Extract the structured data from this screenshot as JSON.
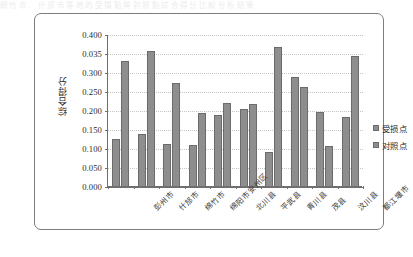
{
  "artifact_text": "綿 竹 市 、 什 邡 市 等 地 的 受 損 點 與 對 照 點 綜 合 得 分 比 較 分 析 結 果",
  "chart_data": {
    "type": "bar",
    "title": "",
    "xlabel": "",
    "ylabel": "综合得分",
    "ylim": [
      0.0,
      0.4
    ],
    "ytick_labels": [
      "0.400",
      "0.035",
      "0.300",
      "0.250",
      "0.200",
      "0.150",
      "0.100",
      "0.050",
      "0.000"
    ],
    "ytick_values": [
      0.4,
      0.35,
      0.3,
      0.25,
      0.2,
      0.15,
      0.1,
      0.05,
      0.0
    ],
    "grid": true,
    "legend_position": "right",
    "categories": [
      "彭州市",
      "什邡市",
      "绵竹市",
      "绵阳市安州区",
      "北川县",
      "平武县",
      "青川县",
      "茂县",
      "汶川县",
      "都江堰市"
    ],
    "series": [
      {
        "name": "受损点",
        "color": "#8e8e8e",
        "values": [
          0.125,
          0.138,
          0.11,
          0.107,
          0.187,
          0.202,
          0.09,
          0.287,
          0.194,
          0.181
        ]
      },
      {
        "name": "对照点",
        "color": "#8e8e8e",
        "values": [
          0.33,
          0.355,
          0.272,
          0.192,
          0.218,
          0.217,
          0.365,
          0.26,
          0.105,
          0.343
        ]
      }
    ]
  }
}
